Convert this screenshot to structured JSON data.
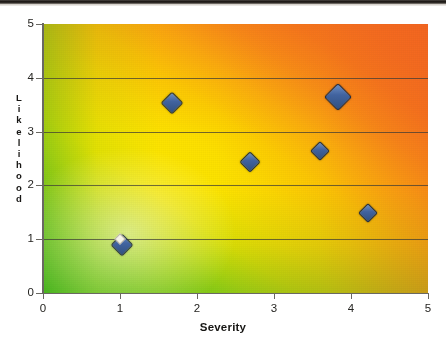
{
  "chart_data": {
    "type": "scatter",
    "title": "",
    "xlabel": "Severity",
    "ylabel": "Likelihood",
    "xlim": [
      0,
      5
    ],
    "ylim": [
      0,
      5
    ],
    "xticks": [
      "0",
      "1",
      "2",
      "3",
      "4",
      "5"
    ],
    "yticks": [
      "0",
      "1",
      "2",
      "3",
      "4",
      "5"
    ],
    "grid": "horizontal",
    "legend": "none",
    "background": "risk-heatmap-gradient green-to-red diagonal",
    "points": [
      {
        "x": 1.03,
        "y": 0.89,
        "size": 14
      },
      {
        "x": 1.68,
        "y": 3.53,
        "size": 14
      },
      {
        "x": 2.69,
        "y": 2.44,
        "size": 13
      },
      {
        "x": 3.6,
        "y": 2.64,
        "size": 12
      },
      {
        "x": 3.83,
        "y": 3.64,
        "size": 18
      },
      {
        "x": 4.22,
        "y": 1.49,
        "size": 12
      }
    ],
    "highlight_points": [
      {
        "x": 1.0,
        "y": 1.0,
        "size": 6
      }
    ],
    "series_name": "Risks",
    "marker_shape": "diamond"
  },
  "colors": {
    "marker_fill": "#41639f",
    "marker_edge": "#1d2b45",
    "highlight_fill": "#f4f2e8",
    "gradient_low": "#3fb023",
    "gradient_mid": "#fbe500",
    "gradient_high": "#f4701e",
    "axis": "#6a6862",
    "gridline": "#3c3a36",
    "text": "#171614"
  },
  "axis_title_letters": {
    "likelihood": [
      "L",
      "i",
      "k",
      "e",
      "l",
      "i",
      "h",
      "o",
      "o",
      "d"
    ]
  }
}
